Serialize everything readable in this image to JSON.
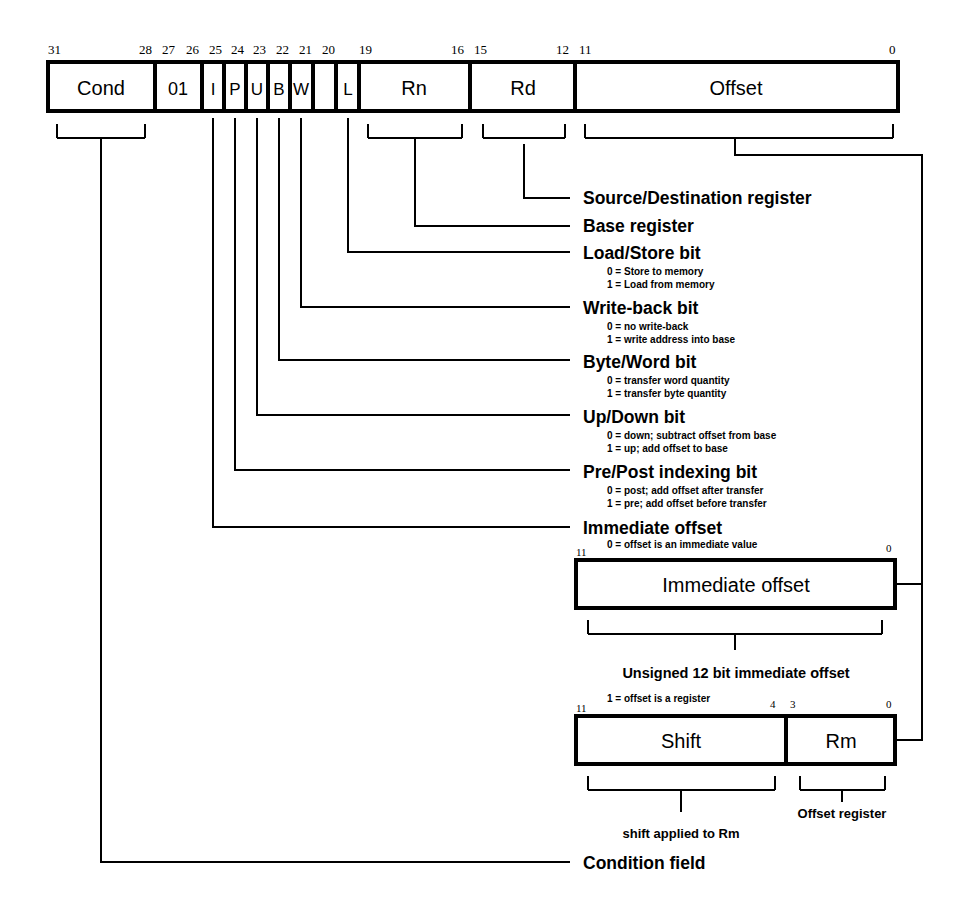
{
  "diagram": {
    "main_word": {
      "bit_labels": [
        "31",
        "28",
        "27",
        "26",
        "25",
        "24",
        "23",
        "22",
        "21",
        "20",
        "19",
        "16",
        "15",
        "12",
        "11",
        "0"
      ],
      "fields": [
        {
          "name": "Cond",
          "hi": "31",
          "lo": "28"
        },
        {
          "name": "01",
          "hi": "27",
          "lo": "26"
        },
        {
          "name": "I",
          "hi": "25",
          "lo": "25"
        },
        {
          "name": "P",
          "hi": "24",
          "lo": "24"
        },
        {
          "name": "U",
          "hi": "23",
          "lo": "23"
        },
        {
          "name": "B",
          "hi": "22",
          "lo": "22"
        },
        {
          "name": "W",
          "hi": "21",
          "lo": "21"
        },
        {
          "name": "L",
          "hi": "20",
          "lo": "20"
        },
        {
          "name": "Rn",
          "hi": "19",
          "lo": "16"
        },
        {
          "name": "Rd",
          "hi": "15",
          "lo": "12"
        },
        {
          "name": "Offset",
          "hi": "11",
          "lo": "0"
        }
      ]
    },
    "annotations": [
      {
        "id": "source-destination-register",
        "title": "Source/Destination register",
        "lines": []
      },
      {
        "id": "base-register",
        "title": "Base register",
        "lines": []
      },
      {
        "id": "load-store-bit",
        "title": "Load/Store bit",
        "lines": [
          "0 = Store to memory",
          "1 = Load from memory"
        ]
      },
      {
        "id": "write-back-bit",
        "title": "Write-back bit",
        "lines": [
          "0 = no write-back",
          "1 = write address into base"
        ]
      },
      {
        "id": "byte-word-bit",
        "title": "Byte/Word bit",
        "lines": [
          "0 = transfer word quantity",
          "1 = transfer byte quantity"
        ]
      },
      {
        "id": "up-down-bit",
        "title": "Up/Down bit",
        "lines": [
          "0 = down; subtract offset from base",
          "1 = up; add offset to base"
        ]
      },
      {
        "id": "pre-post-indexing-bit",
        "title": "Pre/Post indexing bit",
        "lines": [
          "0 = post; add offset after transfer",
          "1 = pre; add offset before transfer"
        ]
      },
      {
        "id": "immediate-offset",
        "title": "Immediate offset",
        "lines": [
          "0 = offset is an immediate value"
        ]
      }
    ],
    "immediate_box": {
      "bit_hi": "11",
      "bit_lo": "0",
      "note": "0 = offset is an immediate value",
      "field_name": "Immediate offset",
      "caption": "Unsigned 12 bit immediate offset"
    },
    "register_box": {
      "bit_hi": "11",
      "bit_mid_hi": "4",
      "bit_mid_lo": "3",
      "bit_lo": "0",
      "note": "1 = offset is a register",
      "fields": [
        {
          "name": "Shift",
          "caption": "shift applied to Rm"
        },
        {
          "name": "Rm",
          "caption": "Offset register"
        }
      ]
    },
    "condition_field_label": "Condition field",
    "colors": {
      "ink": "#000000",
      "paper": "#ffffff"
    }
  }
}
